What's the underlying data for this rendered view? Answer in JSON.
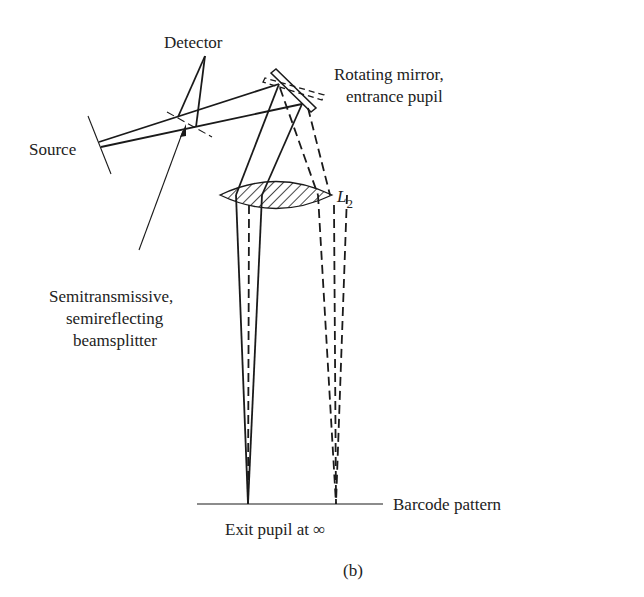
{
  "diagram": {
    "caption": "(b)",
    "labels": {
      "detector": "Detector",
      "source": "Source",
      "mirror_line1": "Rotating mirror,",
      "mirror_line2": "entrance pupil",
      "lens": "L",
      "lens_sub": "2",
      "beamsplitter_line1": "Semitransmissive,",
      "beamsplitter_line2": "semireflecting",
      "beamsplitter_line3": "beamsplitter",
      "barcode": "Barcode pattern",
      "exit_pupil": "Exit pupil at ∞"
    },
    "components": [
      "source",
      "beamsplitter",
      "detector",
      "rotating-mirror",
      "lens-L2",
      "barcode-plane"
    ],
    "colors": {
      "ink": "#1a1a1a",
      "background": "#ffffff"
    }
  }
}
